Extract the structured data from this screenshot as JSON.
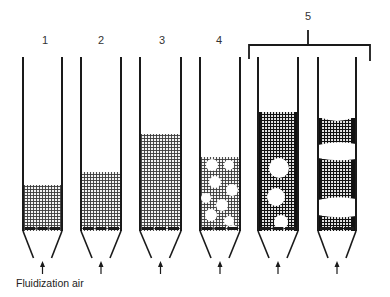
{
  "figure": {
    "caption": "Fluidization air",
    "bracket_label": "5",
    "colors": {
      "ink": "#1a1a1a",
      "background": "#ffffff",
      "particle_fill": "#555555"
    },
    "columns": [
      {
        "label": "1",
        "regime": "fixed bed",
        "x_left": 23,
        "x_right": 62,
        "bed_top": 185,
        "bubbles": [],
        "slugs": []
      },
      {
        "label": "2",
        "regime": "minimum fluidization",
        "x_left": 81,
        "x_right": 121,
        "bed_top": 172,
        "bubbles": [],
        "slugs": []
      },
      {
        "label": "3",
        "regime": "smooth (particulate) fluidization",
        "x_left": 140,
        "x_right": 181,
        "bed_top": 134,
        "bubbles": [],
        "slugs": []
      },
      {
        "label": "4",
        "regime": "bubbling fluidization",
        "x_left": 200,
        "x_right": 240,
        "bed_top": 157,
        "bubbles": [
          [
            212,
            165,
            6
          ],
          [
            229,
            165,
            5
          ],
          [
            215,
            182,
            6
          ],
          [
            232,
            190,
            6
          ],
          [
            206,
            198,
            5
          ],
          [
            222,
            205,
            6
          ],
          [
            211,
            215,
            6
          ],
          [
            229,
            221,
            5
          ],
          [
            233,
            228,
            3
          ]
        ],
        "slugs": []
      },
      {
        "label": "",
        "regime": "slugging (axial slugs)",
        "x_left": 258,
        "x_right": 298,
        "bed_top": 112,
        "bubbles": [
          [
            279,
            168,
            10
          ],
          [
            276,
            197,
            9
          ],
          [
            281,
            222,
            7
          ]
        ],
        "slugs": []
      },
      {
        "label": "",
        "regime": "slugging (flat slugs)",
        "x_left": 318,
        "x_right": 356,
        "bed_top": 118,
        "bubbles": [],
        "slugs": [
          [
            143,
            160
          ],
          [
            198,
            217
          ]
        ]
      }
    ],
    "number_labels": [
      {
        "text": "1",
        "x": 45,
        "y": 44
      },
      {
        "text": "2",
        "x": 101,
        "y": 44
      },
      {
        "text": "3",
        "x": 162,
        "y": 44
      },
      {
        "text": "4",
        "x": 219,
        "y": 44
      }
    ]
  }
}
